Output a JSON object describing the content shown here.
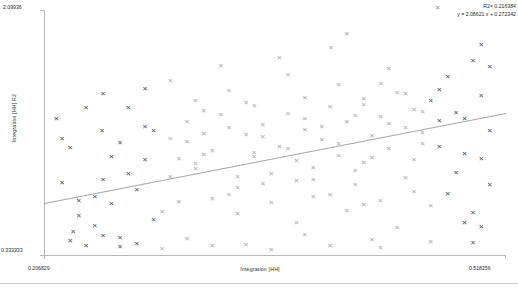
{
  "chart_data": {
    "type": "scatter",
    "title": "",
    "xlabel": "Integration [HH]",
    "ylabel": "Integration [HH] R2",
    "xlim": [
      0.206829,
      0.518256
    ],
    "ylim": [
      0.333333,
      2.09936
    ],
    "xtick_labels": [
      "0.206829",
      "0.518256"
    ],
    "ytick_labels": [
      "0.333333",
      "2.09936"
    ],
    "grid": false,
    "legend_position": "top-right",
    "annotations": {
      "r2_label": "R2= 0.216384",
      "equation": "y = 2.08621 x + 0.272342",
      "marker_glyph": "✕"
    },
    "trendline": {
      "slope": 2.08621,
      "intercept": 0.272342,
      "r2": 0.216384,
      "color": "#8c8c8c"
    },
    "series": [
      {
        "name": "Integration [HH] R2",
        "marker": "x",
        "colors": [
          "#4a4a4a",
          "#a6a6a6"
        ],
        "points": [
          [
            0.2151,
            1.3122,
            "d"
          ],
          [
            0.2246,
            1.1038,
            "d"
          ],
          [
            0.2189,
            0.8455,
            "d"
          ],
          [
            0.2302,
            0.7218,
            "d"
          ],
          [
            0.2265,
            0.4988,
            "d"
          ],
          [
            0.241,
            0.5402,
            "d"
          ],
          [
            0.2466,
            0.4672,
            "d"
          ],
          [
            0.2523,
            0.6985,
            "d"
          ],
          [
            0.258,
            0.451,
            "d"
          ],
          [
            0.2636,
            0.9122,
            "d"
          ],
          [
            0.2693,
            0.8014,
            "d"
          ],
          [
            0.275,
            1.2558,
            "d"
          ],
          [
            0.2466,
            1.4922,
            "d"
          ],
          [
            0.2352,
            1.389,
            "d"
          ],
          [
            0.258,
            1.1372,
            "d"
          ],
          [
            0.2806,
            0.584,
            "d"
          ],
          [
            0.2863,
            0.642,
            "m"
          ],
          [
            0.292,
            0.89,
            "m"
          ],
          [
            0.2976,
            1.021,
            "m"
          ],
          [
            0.3033,
            1.141,
            "m"
          ],
          [
            0.309,
            0.949,
            "m"
          ],
          [
            0.3146,
            1.202,
            "m"
          ],
          [
            0.3203,
            1.077,
            "m"
          ],
          [
            0.326,
            1.336,
            "m"
          ],
          [
            0.3316,
            0.764,
            "m"
          ],
          [
            0.3373,
            0.891,
            "m"
          ],
          [
            0.343,
            1.195,
            "m"
          ],
          [
            0.3486,
            1.038,
            "m"
          ],
          [
            0.3543,
            1.268,
            "m"
          ],
          [
            0.36,
            0.912,
            "m"
          ],
          [
            0.3656,
            1.11,
            "m"
          ],
          [
            0.3713,
            1.348,
            "m"
          ],
          [
            0.377,
            1.005,
            "m"
          ],
          [
            0.3826,
            1.229,
            "m"
          ],
          [
            0.3883,
            0.872,
            "m"
          ],
          [
            0.394,
            1.161,
            "m"
          ],
          [
            0.3996,
            1.394,
            "m"
          ],
          [
            0.4053,
            1.044,
            "m"
          ],
          [
            0.411,
            1.286,
            "m"
          ],
          [
            0.4166,
            0.933,
            "m"
          ],
          [
            0.4223,
            1.452,
            "m"
          ],
          [
            0.428,
            1.184,
            "m"
          ],
          [
            0.4336,
            1.321,
            "m"
          ],
          [
            0.4393,
            1.092,
            "m"
          ],
          [
            0.445,
            1.501,
            "m"
          ],
          [
            0.4506,
            1.244,
            "m"
          ],
          [
            0.4563,
            1.376,
            "m"
          ],
          [
            0.462,
            1.128,
            "m"
          ],
          [
            0.4676,
            1.438,
            "d"
          ],
          [
            0.4733,
            1.293,
            "d"
          ],
          [
            0.479,
            1.612,
            "d"
          ],
          [
            0.4846,
            1.352,
            "d"
          ],
          [
            0.4903,
            1.061,
            "d"
          ],
          [
            0.496,
            1.728,
            "d"
          ],
          [
            0.5016,
            1.479,
            "d"
          ],
          [
            0.5073,
            1.221,
            "d"
          ],
          [
            0.411,
            1.925,
            "m"
          ],
          [
            0.5016,
            1.842,
            "d"
          ],
          [
            0.292,
            1.582,
            "m"
          ],
          [
            0.3316,
            1.511,
            "m"
          ],
          [
            0.3713,
            1.624,
            "m"
          ],
          [
            0.4053,
            1.558,
            "m"
          ],
          [
            0.4393,
            1.668,
            "m"
          ],
          [
            0.309,
            1.443,
            "m"
          ],
          [
            0.3486,
            1.401,
            "m"
          ],
          [
            0.3826,
            1.462,
            "m"
          ],
          [
            0.4166,
            1.333,
            "m"
          ],
          [
            0.4506,
            1.492,
            "m"
          ],
          [
            0.2806,
            1.227,
            "d"
          ],
          [
            0.3146,
            1.051,
            "m"
          ],
          [
            0.3543,
            0.838,
            "m"
          ],
          [
            0.3883,
            0.745,
            "m"
          ],
          [
            0.4223,
            0.691,
            "m"
          ],
          [
            0.4563,
            0.782,
            "m"
          ],
          [
            0.2976,
            0.711,
            "m"
          ],
          [
            0.3373,
            0.623,
            "m"
          ],
          [
            0.377,
            0.561,
            "m"
          ],
          [
            0.411,
            0.644,
            "m"
          ],
          [
            0.445,
            0.521,
            "m"
          ],
          [
            0.2693,
            0.412,
            "d"
          ],
          [
            0.3033,
            0.448,
            "m"
          ],
          [
            0.343,
            0.401,
            "m"
          ],
          [
            0.3826,
            0.472,
            "m"
          ],
          [
            0.428,
            0.436,
            "m"
          ],
          [
            0.258,
            0.386,
            "d"
          ],
          [
            0.2863,
            0.372,
            "m"
          ],
          [
            0.3203,
            0.398,
            "m"
          ],
          [
            0.36,
            0.364,
            "m"
          ],
          [
            0.3996,
            0.391,
            "m"
          ],
          [
            0.4336,
            0.378,
            "m"
          ],
          [
            0.4676,
            0.421,
            "m"
          ],
          [
            0.5016,
            0.534,
            "d"
          ],
          [
            0.496,
            0.418,
            "d"
          ],
          [
            0.2246,
            0.431,
            "d"
          ],
          [
            0.2352,
            0.395,
            "d"
          ],
          [
            0.326,
            1.692,
            "m"
          ],
          [
            0.3656,
            1.751,
            "m"
          ],
          [
            0.4003,
            1.824,
            "m"
          ],
          [
            0.434,
            1.564,
            "m"
          ],
          [
            0.4733,
            1.521,
            "d"
          ],
          [
            0.5073,
            1.684,
            "d"
          ],
          [
            0.246,
            1.221,
            "d"
          ],
          [
            0.275,
            1.012,
            "d"
          ],
          [
            0.3146,
            1.371,
            "m"
          ],
          [
            0.3543,
            1.178,
            "m"
          ],
          [
            0.394,
            1.253,
            "m"
          ],
          [
            0.428,
            1.028,
            "m"
          ],
          [
            0.462,
            1.208,
            "m"
          ],
          [
            0.4903,
            1.312,
            "d"
          ],
          [
            0.292,
            1.164,
            "m"
          ],
          [
            0.3316,
            1.244,
            "m"
          ],
          [
            0.3713,
            1.091,
            "m"
          ],
          [
            0.4053,
            1.131,
            "m"
          ],
          [
            0.4393,
            1.271,
            "m"
          ],
          [
            0.4733,
            1.106,
            "d"
          ],
          [
            0.309,
            0.984,
            "m"
          ],
          [
            0.3486,
            1.062,
            "m"
          ],
          [
            0.3883,
            0.955,
            "m"
          ],
          [
            0.4223,
            0.994,
            "m"
          ],
          [
            0.4563,
            1.018,
            "m"
          ],
          [
            0.4846,
            0.921,
            "d"
          ],
          [
            0.3373,
            0.811,
            "m"
          ],
          [
            0.377,
            0.864,
            "m"
          ],
          [
            0.4166,
            0.832,
            "m"
          ],
          [
            0.4506,
            0.885,
            "m"
          ],
          [
            0.479,
            0.772,
            "d"
          ],
          [
            0.3203,
            0.731,
            "m"
          ],
          [
            0.36,
            0.704,
            "m"
          ],
          [
            0.3996,
            0.763,
            "m"
          ],
          [
            0.4336,
            0.721,
            "m"
          ],
          [
            0.4676,
            0.685,
            "m"
          ],
          [
            0.2636,
            1.391,
            "d"
          ],
          [
            0.275,
            1.524,
            "d"
          ],
          [
            0.3033,
            1.291,
            "m"
          ],
          [
            0.343,
            1.424,
            "m"
          ],
          [
            0.3826,
            1.312,
            "m"
          ],
          [
            0.4223,
            1.411,
            "m"
          ],
          [
            0.462,
            1.362,
            "m"
          ],
          [
            0.5016,
            1.024,
            "d"
          ],
          [
            0.2466,
            0.872,
            "d"
          ],
          [
            0.2523,
            1.036,
            "d"
          ],
          [
            0.2189,
            1.164,
            "d"
          ],
          [
            0.5073,
            0.831,
            "d"
          ],
          [
            0.496,
            0.634,
            "d"
          ],
          [
            0.4903,
            0.562,
            "d"
          ],
          [
            0.2302,
            0.612,
            "d"
          ],
          [
            0.241,
            0.751,
            "d"
          ]
        ]
      }
    ]
  }
}
